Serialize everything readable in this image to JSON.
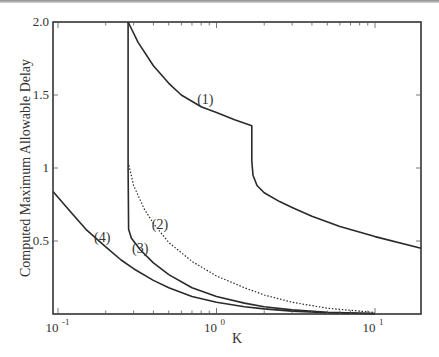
{
  "chart_data": {
    "type": "line",
    "title": "",
    "xlabel": "K",
    "ylabel": "Computed Maximum Allowable Delay",
    "xscale": "log",
    "xlim": [
      0.093,
      19.5
    ],
    "ylim": [
      0,
      2.0
    ],
    "grid": false,
    "legend": "inline labels",
    "x_ticks": [
      {
        "value": 0.1,
        "base": "10",
        "exp": "-1"
      },
      {
        "value": 1,
        "base": "10",
        "exp": "0"
      },
      {
        "value": 10,
        "base": "10",
        "exp": "1"
      }
    ],
    "y_ticks": [
      {
        "value": 0.5,
        "label": "0.5"
      },
      {
        "value": 1.0,
        "label": "1"
      },
      {
        "value": 1.5,
        "label": "1.5"
      },
      {
        "value": 2.0,
        "label": "2.0"
      }
    ],
    "series": [
      {
        "name": "(1)",
        "style": "solid",
        "points": [
          [
            0.277,
            2.0
          ],
          [
            0.32,
            1.86
          ],
          [
            0.4,
            1.7
          ],
          [
            0.5,
            1.58
          ],
          [
            0.6,
            1.5
          ],
          [
            0.8,
            1.42
          ],
          [
            1.0,
            1.38
          ],
          [
            1.3,
            1.33
          ],
          [
            1.67,
            1.29
          ],
          [
            1.67,
            1.05
          ],
          [
            1.7,
            0.95
          ],
          [
            1.8,
            0.88
          ],
          [
            2.0,
            0.83
          ],
          [
            2.5,
            0.77
          ],
          [
            3.0,
            0.73
          ],
          [
            4.0,
            0.67
          ],
          [
            6.0,
            0.6
          ],
          [
            10.0,
            0.53
          ],
          [
            19.5,
            0.45
          ]
        ],
        "label_pos": [
          0.85,
          1.44
        ]
      },
      {
        "name": "(2)",
        "style": "dotted",
        "points": [
          [
            0.28,
            1.02
          ],
          [
            0.3,
            0.88
          ],
          [
            0.35,
            0.72
          ],
          [
            0.4,
            0.62
          ],
          [
            0.5,
            0.49
          ],
          [
            0.7,
            0.36
          ],
          [
            1.0,
            0.26
          ],
          [
            1.5,
            0.18
          ],
          [
            2.0,
            0.13
          ],
          [
            3.0,
            0.08
          ],
          [
            5.0,
            0.04
          ],
          [
            10.0,
            0.01
          ]
        ],
        "label_pos": [
          0.44,
          0.58
        ]
      },
      {
        "name": "(3)",
        "style": "solid",
        "points": [
          [
            0.277,
            2.0
          ],
          [
            0.277,
            1.0
          ],
          [
            0.279,
            0.58
          ],
          [
            0.29,
            0.52
          ],
          [
            0.33,
            0.44
          ],
          [
            0.4,
            0.35
          ],
          [
            0.5,
            0.27
          ],
          [
            0.7,
            0.18
          ],
          [
            1.0,
            0.12
          ],
          [
            1.5,
            0.075
          ],
          [
            2.0,
            0.05
          ],
          [
            3.0,
            0.028
          ],
          [
            5.0,
            0.012
          ],
          [
            10.0,
            0.003
          ]
        ],
        "label_pos": [
          0.33,
          0.42
        ]
      },
      {
        "name": "(4)",
        "style": "solid",
        "points": [
          [
            0.093,
            0.84
          ],
          [
            0.12,
            0.7
          ],
          [
            0.15,
            0.58
          ],
          [
            0.2,
            0.46
          ],
          [
            0.25,
            0.37
          ],
          [
            0.3,
            0.31
          ],
          [
            0.4,
            0.23
          ],
          [
            0.5,
            0.18
          ],
          [
            0.7,
            0.12
          ],
          [
            1.0,
            0.08
          ],
          [
            1.5,
            0.05
          ],
          [
            2.0,
            0.035
          ],
          [
            3.0,
            0.02
          ],
          [
            5.0,
            0.008
          ],
          [
            10.0,
            0.002
          ]
        ],
        "label_pos": [
          0.19,
          0.49
        ]
      }
    ]
  }
}
